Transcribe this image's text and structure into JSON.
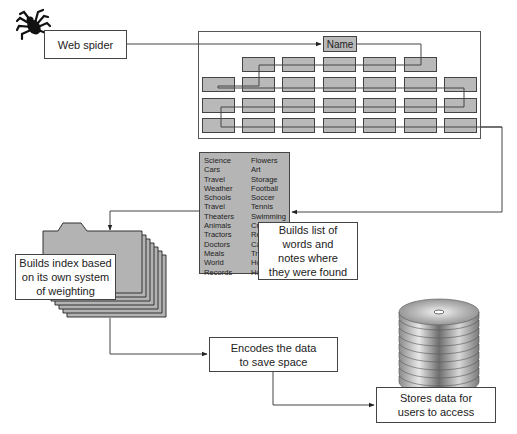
{
  "diagram": {
    "spider": {
      "icon": "spider-icon",
      "label": "Web spider"
    },
    "page_grid": {
      "name_label": "Name",
      "rows": [
        {
          "row": 1,
          "cells": 5
        },
        {
          "row": 2,
          "cells": 7
        },
        {
          "row": 3,
          "cells": 7
        },
        {
          "row": 4,
          "cells": 7
        }
      ]
    },
    "word_list": {
      "column1": [
        "Science",
        "Cars",
        "Travel",
        "Weather",
        "Schools",
        "Travel",
        "Theaters",
        "Animals",
        "Tractors",
        "Doctors",
        "Meals",
        "World",
        "Records"
      ],
      "column2": [
        "Flowers",
        "Art",
        "Storage",
        "Football",
        "Soccer",
        "Tennis",
        "Swimming",
        "Cr",
        "Re",
        "Ca",
        "Tr",
        "Ho",
        "Ho"
      ]
    },
    "steps": {
      "build_list": "Builds list of\nwords and\nnotes where\nthey were found",
      "build_index": "Builds index based\non its own system\nof weighting",
      "encode": "Encodes the data\nto save space",
      "store": "Stores data for\nusers to access"
    },
    "icons": {
      "index": "folder-stack-icon",
      "storage": "disc-stack-icon"
    },
    "colors": {
      "cell_fill": "#b9b9b9",
      "line": "#444444",
      "background": "#ffffff"
    }
  }
}
